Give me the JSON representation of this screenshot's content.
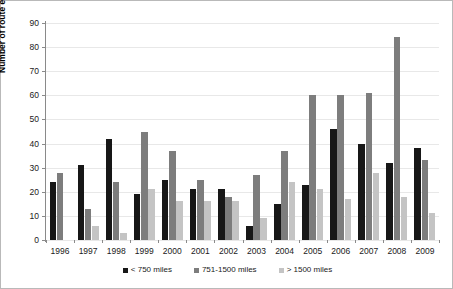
{
  "chart_data": {
    "type": "bar",
    "title": "",
    "subtitle": "",
    "xlabel": "",
    "ylabel": "Number of route entries",
    "ylim": [
      0,
      90
    ],
    "ytick_step": 10,
    "yticks": [
      0,
      10,
      20,
      30,
      40,
      50,
      60,
      70,
      80,
      90
    ],
    "grid": true,
    "legend_position": "bottom",
    "categories": [
      "1996",
      "1997",
      "1998",
      "1999",
      "2000",
      "2001",
      "2002",
      "2003",
      "2004",
      "2005",
      "2006",
      "2007",
      "2008",
      "2009"
    ],
    "series": [
      {
        "name": "< 750 miles",
        "color": "#171717",
        "values": [
          24,
          31,
          42,
          19,
          25,
          21,
          21,
          6,
          15,
          23,
          46,
          40,
          32,
          38
        ]
      },
      {
        "name": "751-1500 miles",
        "color": "#7d7d7d",
        "values": [
          28,
          13,
          24,
          45,
          37,
          25,
          18,
          27,
          37,
          60,
          60,
          61,
          84,
          33
        ]
      },
      {
        "name": "> 1500 miles",
        "color": "#c4c4c4",
        "values": [
          0,
          6,
          3,
          21,
          16,
          16,
          16,
          9,
          24,
          21,
          17,
          28,
          18,
          11
        ]
      }
    ]
  }
}
